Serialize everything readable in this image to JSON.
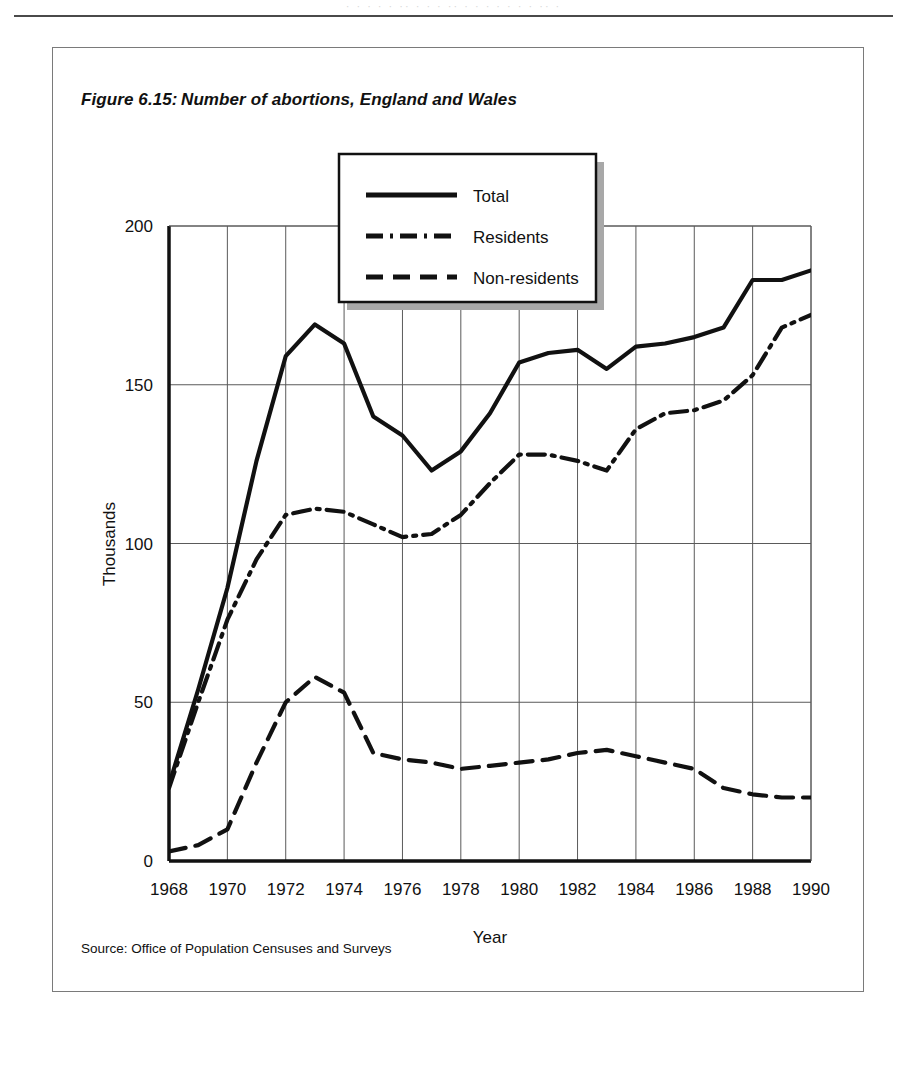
{
  "page": {
    "bleed_text": "· · ·  ·   ·  ·· ·  ·  ·   ·· ·   ·  · ·  ·   · ·  ·· ·",
    "rule": "horizontal-rule"
  },
  "figure": {
    "number": "Figure 6.15:",
    "title": "Number of abortions, England and Wales",
    "source": "Source: Office of Population Censuses and Surveys"
  },
  "chart_data": {
    "type": "line",
    "title": "Number of abortions, England and Wales",
    "xlabel": "Year",
    "ylabel": "Thousands",
    "xlim": [
      1968,
      1990
    ],
    "ylim": [
      0,
      200
    ],
    "xticks": [
      1968,
      1970,
      1972,
      1974,
      1976,
      1978,
      1980,
      1982,
      1984,
      1986,
      1988,
      1990
    ],
    "yticks": [
      0,
      50,
      100,
      150,
      200
    ],
    "grid": true,
    "legend_position": "top-center",
    "x": [
      1968,
      1969,
      1970,
      1971,
      1972,
      1973,
      1974,
      1975,
      1976,
      1977,
      1978,
      1979,
      1980,
      1981,
      1982,
      1983,
      1984,
      1985,
      1986,
      1987,
      1988,
      1989,
      1990
    ],
    "series": [
      {
        "name": "Total",
        "style": "solid",
        "values": [
          24,
          54,
          86,
          126,
          159,
          169,
          163,
          140,
          134,
          123,
          129,
          141,
          157,
          160,
          161,
          155,
          162,
          163,
          165,
          168,
          183,
          183,
          186
        ]
      },
      {
        "name": "Residents",
        "style": "dash-dot",
        "values": [
          23,
          50,
          76,
          95,
          109,
          111,
          110,
          106,
          102,
          103,
          109,
          119,
          128,
          128,
          126,
          123,
          136,
          141,
          142,
          145,
          153,
          168,
          172
        ]
      },
      {
        "name": "Non-residents",
        "style": "dashed",
        "values": [
          3,
          5,
          10,
          31,
          50,
          58,
          53,
          34,
          32,
          31,
          29,
          30,
          31,
          32,
          34,
          35,
          33,
          31,
          29,
          23,
          21,
          20,
          20
        ]
      }
    ]
  },
  "legend": {
    "items": [
      {
        "label": "Total",
        "style": "solid"
      },
      {
        "label": "Residents",
        "style": "dash-dot"
      },
      {
        "label": "Non-residents",
        "style": "dashed"
      }
    ]
  },
  "colors": {
    "ink": "#111111",
    "grid": "#5a5a5a",
    "frame": "#7a7a7a",
    "shadow": "#9a9a9a"
  }
}
